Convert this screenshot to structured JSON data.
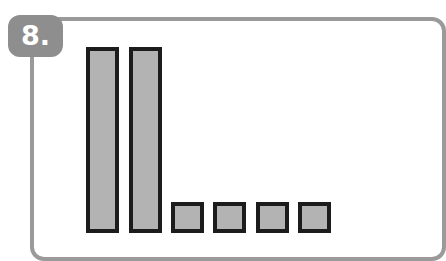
{
  "badge": {
    "label": "8."
  },
  "colors": {
    "frame": "#9a9a9a",
    "badge": "#8e8e8e",
    "bar_fill": "#b3b3b3",
    "bar_border": "#1c1c1c"
  },
  "chart_data": {
    "type": "bar",
    "title": "",
    "categories": [
      "1",
      "2",
      "3",
      "4",
      "5",
      "6"
    ],
    "values": [
      6,
      6,
      1,
      1,
      1,
      1
    ],
    "xlabel": "",
    "ylabel": "",
    "grid": false,
    "legend": null,
    "ylim": [
      0,
      6
    ]
  }
}
